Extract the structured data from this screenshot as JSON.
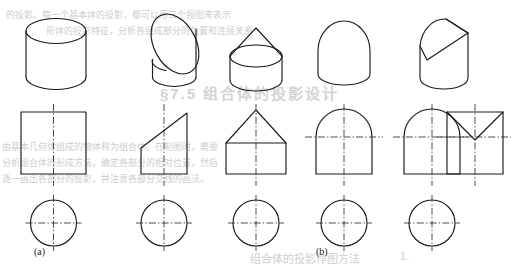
{
  "figure": {
    "width": 513,
    "height": 273,
    "background_color": "#ffffff",
    "line_color": "#1a1a1a",
    "centerline_color": "#2a2a2a",
    "rows": [
      {
        "name": "isometric-row",
        "label": "Isometric pictorial views"
      },
      {
        "name": "front-view-row",
        "label": "Front views (orthographic)"
      },
      {
        "name": "top-view-row",
        "label": "Top views (orthographic)"
      }
    ],
    "captions": [
      {
        "text": "(a)",
        "x": 34,
        "y": 252
      },
      {
        "text": "(b)",
        "x": 316,
        "y": 252
      }
    ],
    "columns": [
      {
        "name": "plain-cylinder",
        "group": "a",
        "pictorial": "cylinder",
        "front_view": "rectangle",
        "top_view": "circle",
        "centerlines": [
          "vertical"
        ]
      },
      {
        "name": "obliquely-cut-cylinder",
        "group": "b",
        "pictorial": "cylinder-cut-by-oblique-plane",
        "front_view": "trapezoid-with-slanted-top",
        "top_view": "circle",
        "centerlines": [
          "vertical"
        ]
      },
      {
        "name": "cone-topped-cylinder",
        "group": "b",
        "pictorial": "cylinder-with-cone-on-top",
        "front_view": "pentagon-house-shape",
        "top_view": "circle",
        "centerlines": [
          "vertical"
        ]
      },
      {
        "name": "dome-topped-cylinder",
        "group": "b",
        "pictorial": "cylinder-with-hemisphere-on-top",
        "front_view": "rectangle-with-semicircular-top",
        "top_view": "circle",
        "centerlines": [
          "vertical",
          "horizontal"
        ]
      },
      {
        "name": "v-notched-cylinder",
        "group": "b",
        "pictorial": "cylinder-with-v-notch-cut",
        "front_view": "square-with-v-notch",
        "top_view": "circle",
        "centerlines": [
          "vertical",
          "horizontal"
        ],
        "extra_front_view": "dome-shape"
      }
    ]
  },
  "bleed_through_text": [
    {
      "text": "的投影。每一个基本体的投影，都可以用三个视图来表示",
      "x": 6,
      "y": 8,
      "size": 9
    },
    {
      "text": "形体的投影特征，分析各组成部分的位置和连接关系",
      "x": 46,
      "y": 24,
      "size": 9
    },
    {
      "text": "§7.5 组合体的投影设计",
      "x": 160,
      "y": 82,
      "size": 15,
      "big": true
    },
    {
      "text": "由基本几何体组成的物体称为组合体。在制图时，需要",
      "x": 2,
      "y": 140,
      "size": 9
    },
    {
      "text": "分析组合体的形成方法，确定各部分的相对位置，然后",
      "x": 2,
      "y": 156,
      "size": 9
    },
    {
      "text": "逐一画出各部分的投影，并注意各部分交线的画法。",
      "x": 2,
      "y": 172,
      "size": 9
    },
    {
      "text": "组合体的投影作图方法",
      "x": 250,
      "y": 250,
      "size": 11
    },
    {
      "text": "1.",
      "x": 400,
      "y": 250,
      "size": 11
    }
  ]
}
